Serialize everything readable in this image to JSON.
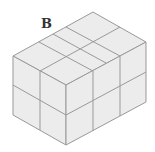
{
  "diagram": {
    "label": "B",
    "colors": {
      "face": "#ececec",
      "edge": "#999999",
      "label": "#333333"
    }
  }
}
